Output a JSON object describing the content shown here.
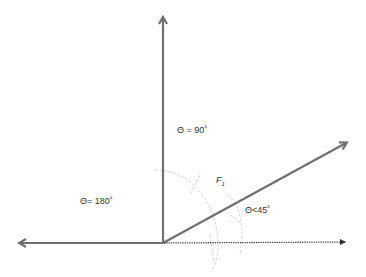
{
  "diagram": {
    "type": "vector-angle-diagram",
    "colors": {
      "arrow": "#707070",
      "dotted": "#444444",
      "arc": "#c8c8c8",
      "text": "#333333"
    },
    "origin": {
      "x": 163,
      "y": 243
    },
    "vectors": [
      {
        "name": "vertical-vector",
        "to": {
          "x": 163,
          "y": 16
        },
        "style": "solid"
      },
      {
        "name": "left-vector",
        "to": {
          "x": 18,
          "y": 243
        },
        "style": "solid"
      },
      {
        "name": "force-vector-f1",
        "to": {
          "x": 348,
          "y": 142
        },
        "style": "solid"
      },
      {
        "name": "reference-axis",
        "to": {
          "x": 350,
          "y": 242
        },
        "style": "dotted"
      }
    ],
    "labels": {
      "theta_90": "Θ = 90˚",
      "theta_180": "Θ= 180˚",
      "force_name": "F",
      "force_subscript": "1",
      "theta_lt_45": "Θ<45˚"
    }
  }
}
